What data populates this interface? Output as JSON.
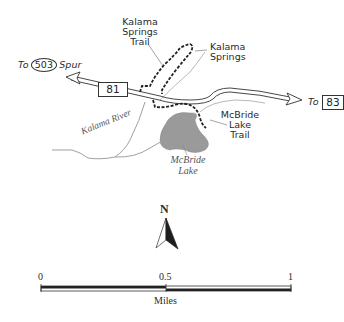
{
  "map": {
    "labels": {
      "kalama_springs_trail": [
        "Kalama",
        "Springs",
        "Trail"
      ],
      "kalama_springs": [
        "Kalama",
        "Springs"
      ],
      "mcbride_lake_trail": [
        "McBride",
        "Lake",
        "Trail"
      ],
      "mcbride_lake": [
        "McBride",
        "Lake"
      ],
      "kalama_river": "Kalama River"
    },
    "roads": {
      "west_prefix": "To",
      "west_route": "503",
      "west_suffix": "Spur",
      "main_route": "81",
      "east_prefix": "To",
      "east_route": "83"
    },
    "north_arrow": {
      "label": "N"
    },
    "scale_bar": {
      "ticks": [
        "0",
        "0.5",
        "1"
      ],
      "unit": "Miles"
    },
    "colors": {
      "lake_fill": "#9a9a9a",
      "trail": "#222222",
      "road_outline": "#333333",
      "river": "#777777"
    }
  }
}
